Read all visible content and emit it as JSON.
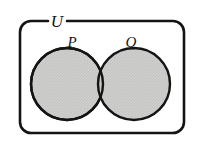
{
  "figure": {
    "kind": "venn-diagram",
    "title": "",
    "background_color": "#ffffff",
    "stroke_color": "#141414",
    "fill_color": "#cbcbc9"
  },
  "universe": {
    "label": "U",
    "shape": "rounded-rectangle",
    "x": 20,
    "y": 21,
    "width": 164,
    "height": 112,
    "corner_radius": 11,
    "stroke_width": 2.6,
    "label_x": 57,
    "label_y": 27,
    "label_gap_start": 48,
    "label_gap_end": 67
  },
  "sets": [
    {
      "label": "P",
      "cx": 67,
      "cy": 84,
      "r": 36,
      "label_x": 72,
      "label_y": 47,
      "fill": "#cbcbc9",
      "stroke": "#141414",
      "stroke_width": 2.4
    },
    {
      "label": "Q",
      "cx": 134,
      "cy": 84,
      "r": 36,
      "label_x": 131,
      "label_y": 47,
      "fill": "#cbcbc9",
      "stroke": "#141414",
      "stroke_width": 2.4
    }
  ],
  "regions": {
    "intersection_shaded": true,
    "outside_shaded": false
  }
}
